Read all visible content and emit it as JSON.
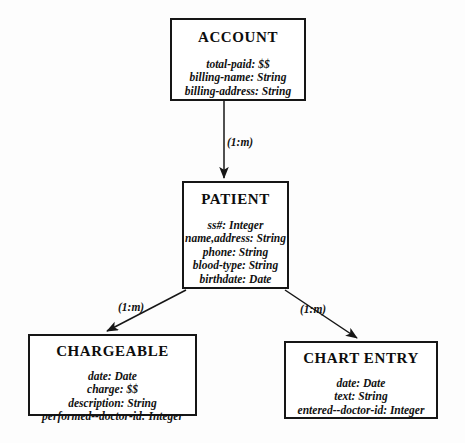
{
  "diagram": {
    "type": "entity-relationship-diagram",
    "entities": [
      {
        "id": "account",
        "name": "ACCOUNT",
        "attributes": [
          "total-paid: $$",
          "billing-name: String",
          "billing-address: String"
        ]
      },
      {
        "id": "patient",
        "name": "PATIENT",
        "attributes": [
          "ss#: Integer",
          "name,address: String",
          "phone: String",
          "blood-type: String",
          "birthdate: Date"
        ]
      },
      {
        "id": "chargeable",
        "name": "CHARGEABLE",
        "attributes": [
          "date: Date",
          "charge: $$",
          "description: String",
          "performed--doctor-id: Integer"
        ]
      },
      {
        "id": "chart_entry",
        "name": "CHART ENTRY",
        "attributes": [
          "date: Date",
          "text: String",
          "entered--doctor-id: Integer"
        ]
      }
    ],
    "relationships": [
      {
        "id": "account_patient",
        "from": "ACCOUNT",
        "to": "PATIENT",
        "cardinality": "(1:m)",
        "style": "vertical-arrow-down"
      },
      {
        "id": "patient_chargeable",
        "from": "PATIENT",
        "to": "CHARGEABLE",
        "cardinality": "(1:m)",
        "style": "diagonal-arrow-down-left"
      },
      {
        "id": "patient_chart_entry",
        "from": "PATIENT",
        "to": "CHART ENTRY",
        "cardinality": "(1:m)",
        "style": "diagonal-arrow-down-right"
      }
    ],
    "colors": {
      "line": "#161616",
      "text": "#111111",
      "background": "#fdfdfd",
      "box_fill": "#ffffff"
    }
  }
}
